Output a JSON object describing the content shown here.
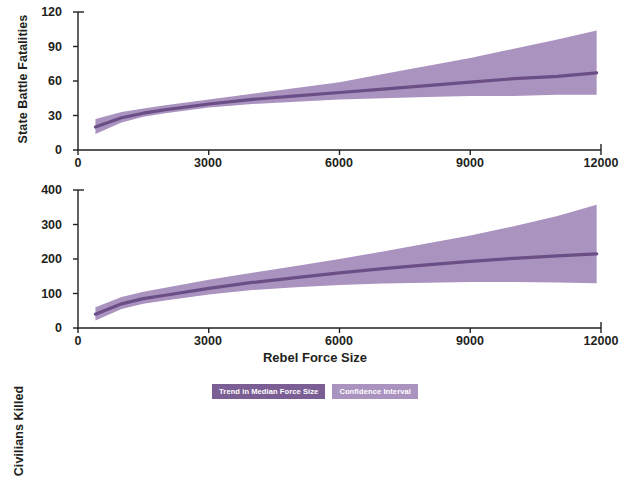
{
  "figure": {
    "xaxis_title": "Rebel Force Size",
    "colors": {
      "median_line": "#6b4e86",
      "ci_band": "#ab93c0",
      "legend_trend_bg": "#7b5f94",
      "legend_ci_bg": "#ab93c0",
      "axis": "#231f20"
    }
  },
  "legend": {
    "position": "bottom-center",
    "items": [
      {
        "label": "Trend in Median Force Size",
        "color": "#7b5f94"
      },
      {
        "label": "Confidence Interval",
        "color": "#ab93c0"
      }
    ]
  },
  "chart_data": [
    {
      "type": "line",
      "title": "",
      "ylabel": "State Battle Fatalities",
      "xlabel": "Rebel Force Size",
      "xlim": [
        0,
        12000
      ],
      "ylim": [
        0,
        120
      ],
      "xticks": [
        0,
        3000,
        6000,
        9000,
        12000
      ],
      "yticks": [
        0,
        30,
        60,
        90,
        120
      ],
      "xtick_labels": [
        "0",
        "3000",
        "6000",
        "9000",
        "12000"
      ],
      "ytick_labels": [
        "0",
        "30",
        "60",
        "90",
        "120"
      ],
      "grid": false,
      "x": [
        400,
        1000,
        1500,
        2000,
        3000,
        4000,
        5000,
        6000,
        7000,
        8000,
        9000,
        10000,
        11000,
        11900
      ],
      "series": [
        {
          "name": "Trend in Median Force Size",
          "values": [
            20,
            28,
            32,
            35,
            40,
            44,
            47,
            50,
            53,
            56,
            59,
            62,
            64,
            67
          ]
        }
      ],
      "confidence_interval": {
        "name": "Confidence Interval",
        "lower": [
          14,
          24,
          29,
          32,
          37,
          40,
          42,
          44,
          45,
          46,
          47,
          47,
          48,
          48
        ],
        "upper": [
          27,
          33,
          36,
          39,
          44,
          49,
          54,
          59,
          66,
          73,
          80,
          88,
          96,
          104
        ]
      }
    },
    {
      "type": "line",
      "title": "",
      "ylabel": "Civilians Killed",
      "xlabel": "Rebel Force Size",
      "xlim": [
        0,
        12000
      ],
      "ylim": [
        0,
        400
      ],
      "xticks": [
        0,
        3000,
        6000,
        9000,
        12000
      ],
      "yticks": [
        0,
        100,
        200,
        300,
        400
      ],
      "xtick_labels": [
        "0",
        "3000",
        "6000",
        "9000",
        "12000"
      ],
      "ytick_labels": [
        "0",
        "100",
        "200",
        "300",
        "400"
      ],
      "grid": false,
      "x": [
        400,
        1000,
        1500,
        2000,
        3000,
        4000,
        5000,
        6000,
        7000,
        8000,
        9000,
        10000,
        11000,
        11900
      ],
      "series": [
        {
          "name": "Trend in Median Force Size",
          "values": [
            40,
            70,
            85,
            95,
            115,
            132,
            146,
            160,
            172,
            183,
            193,
            202,
            209,
            215
          ]
        }
      ],
      "confidence_interval": {
        "name": "Confidence Interval",
        "lower": [
          22,
          55,
          70,
          80,
          97,
          110,
          118,
          125,
          129,
          131,
          133,
          133,
          132,
          130
        ],
        "upper": [
          60,
          90,
          105,
          117,
          140,
          160,
          180,
          200,
          222,
          245,
          268,
          295,
          325,
          357
        ]
      }
    }
  ]
}
